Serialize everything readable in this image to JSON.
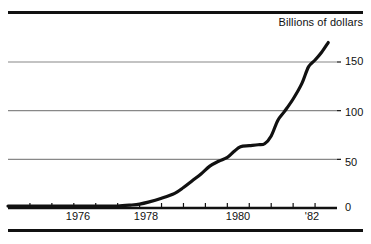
{
  "chart_data": {
    "type": "line",
    "title": "Billions of dollars",
    "xlabel": "",
    "ylabel": "Billions of dollars",
    "grid": true,
    "legend": false,
    "xlim": [
      1975.0,
      1982.5
    ],
    "ylim": [
      0,
      185
    ],
    "yticks": [
      0,
      50,
      100,
      150
    ],
    "ytick_labels": [
      "0",
      "50",
      "100",
      "150"
    ],
    "xticks": [
      1975.5,
      1976.0,
      1976.5,
      1977.0,
      1977.5,
      1978.0,
      1978.5,
      1979.0,
      1979.5,
      1980.0,
      1980.5,
      1981.0,
      1981.5,
      1982.0
    ],
    "xtick_labels": [
      "1976",
      "1978",
      "1980",
      "'82"
    ],
    "xtick_label_positions": [
      1976.0,
      1978.0,
      1980.0,
      1982.0
    ],
    "series": [
      {
        "name": "Money market mutual fund assets",
        "x": [
          1975.0,
          1975.3,
          1975.6,
          1976.0,
          1976.4,
          1976.8,
          1977.2,
          1977.5,
          1977.8,
          1978.0,
          1978.2,
          1978.5,
          1978.8,
          1979.0,
          1979.2,
          1979.4,
          1979.6,
          1979.8,
          1980.0,
          1980.15,
          1980.3,
          1980.5,
          1980.7,
          1980.85,
          1981.0,
          1981.15,
          1981.3,
          1981.5,
          1981.7,
          1981.85,
          1982.0,
          1982.15,
          1982.3
        ],
        "y": [
          2,
          2,
          2,
          2,
          2,
          2,
          2,
          2,
          3,
          4,
          6,
          10,
          15,
          21,
          28,
          35,
          43,
          48,
          52,
          58,
          63,
          64,
          65,
          66,
          74,
          90,
          99,
          112,
          128,
          145,
          152,
          160,
          170
        ],
        "color": "#111111",
        "linewidth": 3.2
      }
    ],
    "axis_line_color": "#111111",
    "grid_color": "#888888"
  },
  "title": {
    "text": "Billions of dollars"
  },
  "y_axis": {
    "labels": [
      {
        "value": "150",
        "top": 55
      },
      {
        "value": "100",
        "top": 106
      },
      {
        "value": "50",
        "top": 156
      },
      {
        "value": "0",
        "top": 201
      }
    ]
  },
  "x_axis": {
    "labels": [
      {
        "value": "1976",
        "left": 78
      },
      {
        "value": "1978",
        "left": 146
      },
      {
        "value": "1980",
        "left": 238
      },
      {
        "value": "'82",
        "left": 312
      }
    ]
  },
  "colors": {
    "ink": "#111111",
    "grid": "#888888",
    "background": "#ffffff"
  }
}
